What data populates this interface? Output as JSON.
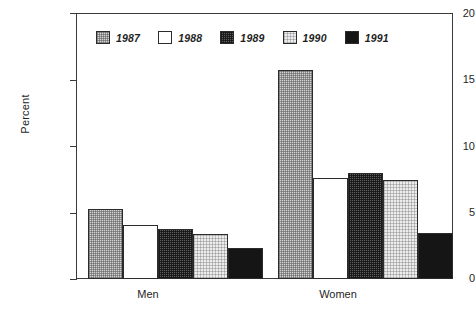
{
  "chart_data": {
    "type": "bar",
    "title": "",
    "xlabel": "",
    "ylabel": "Percent",
    "ylim": [
      0,
      20
    ],
    "yticks": [
      0,
      5,
      10,
      15,
      20
    ],
    "ytick_labels": [
      "0",
      "5",
      "10",
      "15",
      "20"
    ],
    "grid": false,
    "legend_position": "top-left-inside",
    "categories": [
      "Men",
      "Women"
    ],
    "series": [
      {
        "name": "1987",
        "values": [
          5.3,
          15.8
        ],
        "pattern": "stipple-medium",
        "color": "#d3d3d3"
      },
      {
        "name": "1988",
        "values": [
          4.1,
          7.6
        ],
        "pattern": "empty-white",
        "color": "#ffffff"
      },
      {
        "name": "1989",
        "values": [
          3.75,
          8.0
        ],
        "pattern": "crosshatch-dark",
        "color": "#5e5e5e"
      },
      {
        "name": "1990",
        "values": [
          3.4,
          7.45
        ],
        "pattern": "stipple-light",
        "color": "#ededed"
      },
      {
        "name": "1991",
        "values": [
          2.35,
          3.45
        ],
        "pattern": "solid-black",
        "color": "#151515"
      }
    ]
  },
  "axis": {
    "y_title": "Percent",
    "y_labels": [
      "20",
      "15",
      "10",
      "5",
      "0"
    ]
  },
  "legend": {
    "entries": [
      {
        "label": "1987"
      },
      {
        "label": "1988"
      },
      {
        "label": "1989"
      },
      {
        "label": "1990"
      },
      {
        "label": "1991"
      }
    ]
  },
  "categories": {
    "men": "Men",
    "women": "Women"
  }
}
